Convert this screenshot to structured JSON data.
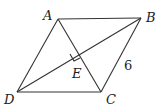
{
  "diagram": {
    "type": "geometry-rhombus",
    "vertices": {
      "A": {
        "label": "A",
        "x": 58,
        "y": 19
      },
      "B": {
        "label": "B",
        "x": 141,
        "y": 18
      },
      "C": {
        "label": "C",
        "x": 101,
        "y": 92
      },
      "D": {
        "label": "D",
        "x": 17,
        "y": 92
      },
      "E": {
        "label": "E",
        "x": 79,
        "y": 55
      }
    },
    "labels": {
      "A": "A",
      "B": "B",
      "C": "C",
      "D": "D",
      "E": "E",
      "side_BC": "6"
    },
    "segments": [
      "AB",
      "BC",
      "CD",
      "DA",
      "AC",
      "BD"
    ],
    "right_angle_at": "E",
    "line_color": "#333333"
  }
}
